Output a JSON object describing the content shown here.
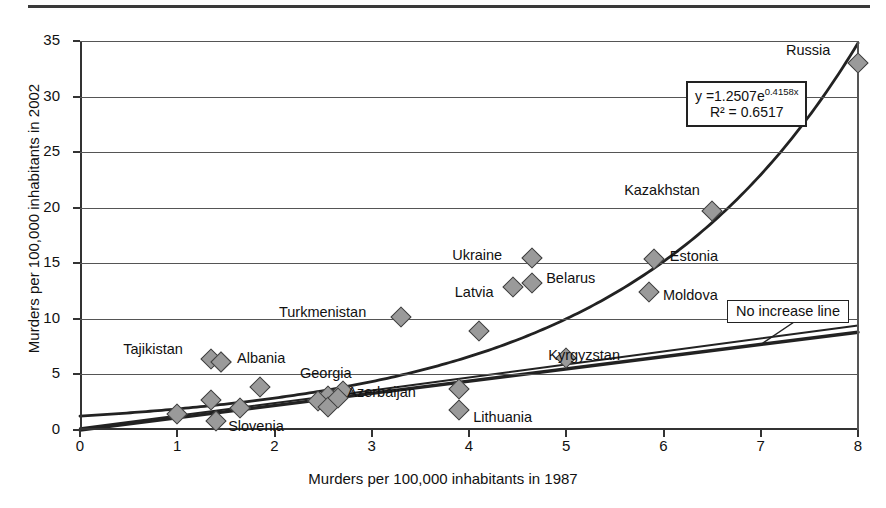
{
  "figure": {
    "top_rule": true,
    "background": "#ffffff",
    "marker_fill": "#9a9a9a",
    "marker_stroke": "#3c3c3c",
    "axis_color": "#333333",
    "grid_color": "#555555"
  },
  "annotations": {
    "equation_line1": "y =1.2507e",
    "equation_exponent": "0.4158x",
    "equation_line2": "R² = 0.6517",
    "no_increase_label": "No increase line"
  },
  "chart_data": {
    "type": "scatter",
    "title": "",
    "xlabel": "Murders per 100,000 inhabitants in 1987",
    "ylabel": "Murders per 100,000 inhabitants in 2002",
    "xlim": [
      0,
      8
    ],
    "ylim": [
      0,
      35
    ],
    "xticks": [
      0,
      1,
      2,
      3,
      4,
      5,
      6,
      7,
      8
    ],
    "yticks": [
      0,
      5,
      10,
      15,
      20,
      25,
      30,
      35
    ],
    "grid": "horizontal",
    "legend": "none",
    "trendline": {
      "kind": "exponential",
      "equation": "y = 1.2507e^(0.4158x)",
      "coefficient": 1.2507,
      "exponent_rate": 0.4158,
      "r_squared": 0.6517
    },
    "reference_line": {
      "kind": "linear",
      "label": "No increase line",
      "slope": 1.1,
      "intercept": 0
    },
    "points": [
      {
        "label": "Tajikistan",
        "x": 1.35,
        "y": 6.4,
        "label_dx": -88,
        "label_dy": -9
      },
      {
        "label": "",
        "x": 1.45,
        "y": 6.1,
        "label_dx": 0,
        "label_dy": 0
      },
      {
        "label": "Albania",
        "x": 1.45,
        "y": 6.1,
        "label_dx": 16,
        "label_dy": -3
      },
      {
        "label": "Slovenia",
        "x": 1.4,
        "y": 0.8,
        "label_dx": 12,
        "label_dy": 6
      },
      {
        "label": "",
        "x": 1.0,
        "y": 1.4,
        "label_dx": 0,
        "label_dy": 0
      },
      {
        "label": "",
        "x": 1.35,
        "y": 2.7,
        "label_dx": 0,
        "label_dy": 0
      },
      {
        "label": "",
        "x": 1.65,
        "y": 2.0,
        "label_dx": 0,
        "label_dy": 0
      },
      {
        "label": "",
        "x": 1.85,
        "y": 3.9,
        "label_dx": 0,
        "label_dy": 0
      },
      {
        "label": "Georgia",
        "x": 2.55,
        "y": 3.1,
        "label_dx": -28,
        "label_dy": -22
      },
      {
        "label": "",
        "x": 2.45,
        "y": 2.6,
        "label_dx": 0,
        "label_dy": 0
      },
      {
        "label": "",
        "x": 2.55,
        "y": 2.1,
        "label_dx": 0,
        "label_dy": 0
      },
      {
        "label": "",
        "x": 2.7,
        "y": 3.5,
        "label_dx": 0,
        "label_dy": 0
      },
      {
        "label": "",
        "x": 2.65,
        "y": 2.9,
        "label_dx": 0,
        "label_dy": 0
      },
      {
        "label": "Azerbaijan",
        "x": 3.9,
        "y": 3.7,
        "label_dx": -112,
        "label_dy": 4
      },
      {
        "label": "Lithuania",
        "x": 3.9,
        "y": 1.8,
        "label_dx": 14,
        "label_dy": 8
      },
      {
        "label": "Turkmenistan",
        "x": 3.3,
        "y": 10.2,
        "label_dx": -122,
        "label_dy": -4
      },
      {
        "label": "",
        "x": 4.1,
        "y": 8.9,
        "label_dx": 0,
        "label_dy": 0
      },
      {
        "label": "Ukraine",
        "x": 4.65,
        "y": 15.5,
        "label_dx": -80,
        "label_dy": -2
      },
      {
        "label": "Latvia",
        "x": 4.45,
        "y": 12.9,
        "label_dx": -58,
        "label_dy": 6
      },
      {
        "label": "Belarus",
        "x": 4.65,
        "y": 13.2,
        "label_dx": 14,
        "label_dy": -4
      },
      {
        "label": "Kyrgyzstan",
        "x": 5.0,
        "y": 6.5,
        "label_dx": -18,
        "label_dy": -2
      },
      {
        "label": "Moldova",
        "x": 5.85,
        "y": 12.4,
        "label_dx": 14,
        "label_dy": 4
      },
      {
        "label": "Estonia",
        "x": 5.9,
        "y": 15.4,
        "label_dx": 16,
        "label_dy": -2
      },
      {
        "label": "Kazakhstan",
        "x": 6.5,
        "y": 19.7,
        "label_dx": -88,
        "label_dy": -20
      },
      {
        "label": "Russia",
        "x": 8.0,
        "y": 33.0,
        "label_dx": -72,
        "label_dy": -12
      }
    ]
  }
}
